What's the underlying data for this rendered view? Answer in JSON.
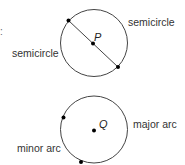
{
  "figure1": {
    "center_label": "P",
    "label_right": "semicircle",
    "label_left": "semicircle"
  },
  "figure2": {
    "center_label": "Q",
    "label_right": "major arc",
    "label_left": "minor arc"
  },
  "edge_fragments": [
    ":",
    "s"
  ],
  "colors": {
    "stroke": "#333333",
    "point": "#000000"
  }
}
